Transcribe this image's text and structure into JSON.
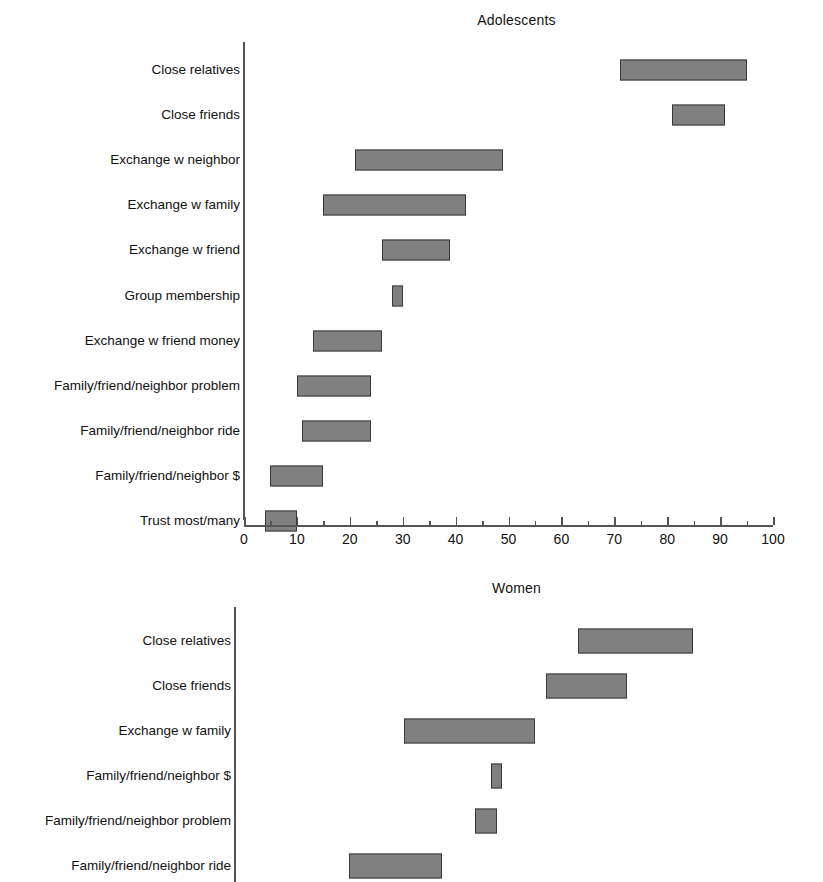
{
  "chart_data": [
    {
      "type": "bar",
      "subtype": "range-bar-horizontal",
      "title": "Adolescents",
      "xlabel": "",
      "ylabel": "",
      "xlim": [
        0,
        100
      ],
      "xticks": [
        0,
        10,
        20,
        30,
        40,
        50,
        60,
        70,
        80,
        90,
        100
      ],
      "xtick_labels": [
        "0",
        "10",
        "20",
        "30",
        "40",
        "50",
        "60",
        "70",
        "80",
        "90",
        "100"
      ],
      "minor_tick_step": 5,
      "grid": false,
      "legend": "none",
      "axis_visible": {
        "x": true,
        "y": true
      },
      "bar_color": "#808080",
      "bar_edge_color": "#3a3a3a",
      "categories": [
        "Close relatives",
        "Close friends",
        "Exchange w neighbor",
        "Exchange w family",
        "Exchange w friend",
        "Group membership",
        "Exchange w friend money",
        "Family/friend/neighbor problem",
        "Family/friend/neighbor ride",
        "Family/friend/neighbor $",
        "Trust most/many"
      ],
      "ranges": [
        {
          "category": "Close relatives",
          "low": 71,
          "high": 95
        },
        {
          "category": "Close friends",
          "low": 81,
          "high": 91
        },
        {
          "category": "Exchange w neighbor",
          "low": 21,
          "high": 49
        },
        {
          "category": "Exchange w family",
          "low": 15,
          "high": 42
        },
        {
          "category": "Exchange w friend",
          "low": 26,
          "high": 39
        },
        {
          "category": "Group membership",
          "low": 28,
          "high": 30
        },
        {
          "category": "Exchange w friend money",
          "low": 13,
          "high": 26
        },
        {
          "category": "Family/friend/neighbor problem",
          "low": 10,
          "high": 24
        },
        {
          "category": "Family/friend/neighbor ride",
          "low": 11,
          "high": 24
        },
        {
          "category": "Family/friend/neighbor $",
          "low": 5,
          "high": 15
        },
        {
          "category": "Trust most/many",
          "low": 4,
          "high": 10
        }
      ]
    },
    {
      "type": "bar",
      "subtype": "range-bar-horizontal",
      "title": "Women",
      "xlabel": "",
      "ylabel": "",
      "xlim": [
        0,
        100
      ],
      "xticks": [],
      "xtick_labels": [],
      "grid": false,
      "legend": "none",
      "axis_visible": {
        "x": false,
        "y": true
      },
      "note": "x-axis cropped off bottom of figure",
      "bar_color": "#808080",
      "bar_edge_color": "#3a3a3a",
      "categories": [
        "Close relatives",
        "Close friends",
        "Exchange w family",
        "Family/friend/neighbor $",
        "Family/friend/neighbor problem",
        "Family/friend/neighbor ride"
      ],
      "ranges": [
        {
          "category": "Close relatives",
          "low": 63,
          "high": 84
        },
        {
          "category": "Close friends",
          "low": 57,
          "high": 72
        },
        {
          "category": "Exchange w family",
          "low": 31,
          "high": 55
        },
        {
          "category": "Family/friend/neighbor $",
          "low": 47,
          "high": 49
        },
        {
          "category": "Family/friend/neighbor problem",
          "low": 44,
          "high": 48
        },
        {
          "category": "Family/friend/neighbor ride",
          "low": 21,
          "high": 38
        }
      ]
    }
  ]
}
